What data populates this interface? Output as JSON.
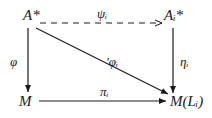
{
  "nodes": {
    "top_left": "A*",
    "top_right": "Aᵢ*",
    "bottom_left": "M",
    "bottom_right": "M(Lᵢ)"
  },
  "arrows": {
    "top": {
      "label": "ψᵢ",
      "from": "A*",
      "to": "Aᵢ*",
      "style": "dashed"
    },
    "left": {
      "label": "φ",
      "from": "A*",
      "to": "M",
      "style": "solid"
    },
    "right": {
      "label": "ηᵢ",
      "from": "Aᵢ*",
      "to": "M(Lᵢ)",
      "style": "solid"
    },
    "bottom": {
      "label": "πᵢ",
      "from": "M",
      "to": "M(Lᵢ)",
      "style": "solid"
    },
    "diagonal": {
      "label": "'φᵢ",
      "from": "A*",
      "to": "M(Lᵢ)",
      "style": "solid"
    }
  },
  "colors": {
    "ink": "#1a1a1a",
    "background": "#ffffff"
  }
}
